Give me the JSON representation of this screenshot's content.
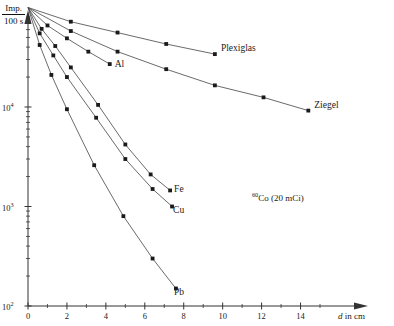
{
  "chart_data": {
    "type": "line",
    "title": "",
    "annotation": "⁶⁰Co (20 mCi)",
    "annotation_isotope_mass": "60",
    "annotation_rest": "Co (20 mCi)",
    "xlabel": "d in cm",
    "xlabel_symbol": "d",
    "xlabel_rest": " in cm",
    "ylabel_numerator": "Imp.",
    "ylabel_denominator": "100 s",
    "yscale": "log",
    "ylim": [
      100,
      150000
    ],
    "xlim": [
      0,
      15.8
    ],
    "y_tick_labels": [
      "10²",
      "10³",
      "10⁴"
    ],
    "y_tick_values": [
      100,
      1000,
      10000
    ],
    "y_tick_bases": [
      "10",
      "10",
      "10"
    ],
    "y_tick_exponents": [
      "2",
      "3",
      "4"
    ],
    "x_tick_labels": [
      "0",
      "2",
      "4",
      "6",
      "8",
      "10",
      "12",
      "14"
    ],
    "x_tick_values": [
      0,
      2,
      4,
      6,
      8,
      10,
      12,
      14
    ],
    "x_minor_ticks": [
      1,
      3,
      5,
      7,
      9,
      11,
      13,
      15
    ],
    "grid": false,
    "legend": "inline-labels",
    "origin_value": 100000,
    "series": [
      {
        "name": "Plexiglas",
        "label": "Plexiglas",
        "x": [
          0,
          2.2,
          4.6,
          7.1,
          9.6
        ],
        "y": [
          100000,
          72000,
          56000,
          43000,
          34000
        ]
      },
      {
        "name": "Ziegel",
        "label": "Ziegel",
        "x": [
          0,
          2.2,
          4.6,
          7.1,
          9.6,
          12.1,
          14.4
        ],
        "y": [
          100000,
          58000,
          36000,
          24000,
          16500,
          12500,
          9200
        ]
      },
      {
        "name": "Al",
        "label": "Al",
        "x": [
          0,
          1.0,
          2.0,
          3.1,
          4.2
        ],
        "y": [
          100000,
          66000,
          49000,
          36000,
          27000
        ]
      },
      {
        "name": "Fe",
        "label": "Fe",
        "x": [
          0,
          0.7,
          1.4,
          2.2,
          3.6,
          5.0,
          6.3,
          7.3
        ],
        "y": [
          100000,
          61000,
          41000,
          25000,
          10500,
          4200,
          2100,
          1450
        ]
      },
      {
        "name": "Cu",
        "label": "Cu",
        "x": [
          0,
          0.6,
          1.3,
          2.0,
          3.5,
          5.0,
          6.4,
          7.4
        ],
        "y": [
          100000,
          55000,
          33000,
          20000,
          7800,
          3000,
          1500,
          1000
        ]
      },
      {
        "name": "Pb",
        "label": "Pb",
        "x": [
          0,
          0.6,
          1.2,
          2.0,
          3.4,
          4.9,
          6.4,
          7.6
        ],
        "y": [
          100000,
          42000,
          21000,
          9500,
          2600,
          800,
          300,
          150
        ]
      }
    ]
  },
  "axis": {
    "y_axis_name": "counts-per-100-seconds",
    "x_axis_name": "absorber-thickness"
  }
}
